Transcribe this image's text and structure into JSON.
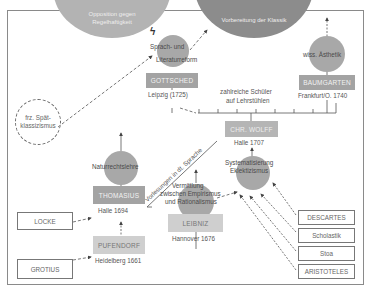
{
  "top_circles": [
    {
      "id": "opposition",
      "label_lines": [
        "Opposition gegen",
        "Regelhaftigkeit"
      ]
    },
    {
      "id": "vorbereitung",
      "label_lines": [
        "Vorbereitung der Klassik"
      ]
    }
  ],
  "circles": {
    "sprach": {
      "label_lines": [
        "Sprach- und",
        "Literaturreform"
      ]
    },
    "aesthetik": {
      "label_lines": [
        "wiss. Ästhetik"
      ]
    },
    "naturrecht": {
      "label_lines": [
        "Naturrechtslehre"
      ]
    },
    "vermittlung": {
      "label_lines": [
        "Vermittlung",
        "zwischen Empirismus",
        "und Rationalismus"
      ]
    },
    "system": {
      "label_lines": [
        "Systematisierung",
        "Eklektizismus"
      ]
    }
  },
  "persons": {
    "gottsched": {
      "name": "GOTTSCHED",
      "place": "Leipzig (1725)"
    },
    "baumgarten": {
      "name": "BAUMGARTEN",
      "place": "Frankfurt/O. 1740"
    },
    "wolff": {
      "name": "CHR. WOLFF",
      "place": "Halle 1707"
    },
    "thomasius": {
      "name": "THOMASIUS",
      "place": "Halle 1694"
    },
    "pufendorf": {
      "name": "PUFENDORF",
      "place": "Heidelberg 1661"
    },
    "leibniz": {
      "name": "LEIBNIZ",
      "place": "Hannover 1676"
    }
  },
  "sources": {
    "locke": "LOCKE",
    "grotius": "GROTIUS",
    "descartes": "DESCARTES",
    "scholastik": "Scholastik",
    "stoa": "Stoa",
    "aristoteles": "ARISTOTELES"
  },
  "dashed_circle": {
    "label_lines": [
      "frz. Spät-",
      "klassizismus"
    ]
  },
  "notes": {
    "schueler_lines": [
      "zahlreiche Schüler",
      "auf Lehrstühlen"
    ],
    "vorlesungen": "Vorlesungen in dt. Sprache",
    "conflict_symbol": "ϟ"
  },
  "colors": {
    "top_circle_light": "#b3b3b3",
    "top_circle_dark": "#8c8c8c",
    "circle": "#a8a8a8",
    "person_box": "#a3a3a3",
    "person_box_light": "#cfcfcf",
    "frame": "#8a8a8a"
  }
}
